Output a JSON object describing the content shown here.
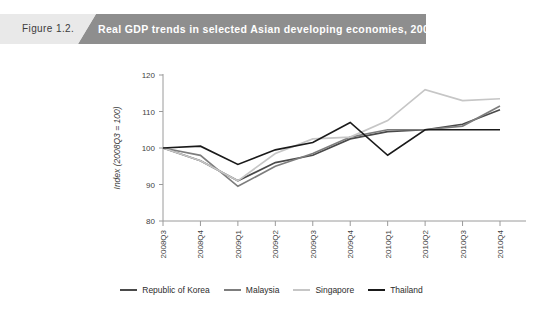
{
  "banner": {
    "figure_number": "Figure 1.2.",
    "title": "Real GDP trends in selected Asian developing economies, 2008-2010"
  },
  "chart_data": {
    "type": "line",
    "title": "Real GDP trends in selected Asian developing economies, 2008-2010",
    "xlabel": "",
    "ylabel": "Index (2008Q3 = 100)",
    "ylim": [
      80,
      120
    ],
    "yticks": [
      80,
      90,
      100,
      110,
      120
    ],
    "grid": false,
    "legend_position": "bottom",
    "categories": [
      "2008Q3",
      "2008Q4",
      "2009Q1",
      "2009Q2",
      "2009Q3",
      "2009Q4",
      "2010Q1",
      "2010Q2",
      "2010Q3",
      "2010Q4"
    ],
    "series": [
      {
        "name": "Republic of Korea",
        "color": "#4a4a4a",
        "values": [
          100,
          96.5,
          91,
          96,
          98,
          102.5,
          104.5,
          105,
          106.5,
          110.5
        ]
      },
      {
        "name": "Malaysia",
        "color": "#7d7d7d",
        "values": [
          100,
          98,
          89.5,
          95,
          98.5,
          103,
          105,
          105,
          106,
          111.5
        ]
      },
      {
        "name": "Singapore",
        "color": "#c6c6c6",
        "values": [
          100,
          96.5,
          91,
          98.5,
          102.5,
          103,
          107.5,
          116,
          113,
          113.5
        ]
      },
      {
        "name": "Thailand",
        "color": "#1a1a1a",
        "values": [
          100,
          100.5,
          95.5,
          99.5,
          101.5,
          107,
          98,
          105,
          105,
          105
        ]
      }
    ]
  },
  "legend": {
    "items": [
      {
        "label": "Republic of Korea",
        "color": "#4a4a4a"
      },
      {
        "label": "Malaysia",
        "color": "#7d7d7d"
      },
      {
        "label": "Singapore",
        "color": "#c6c6c6"
      },
      {
        "label": "Thailand",
        "color": "#1a1a1a"
      }
    ]
  }
}
